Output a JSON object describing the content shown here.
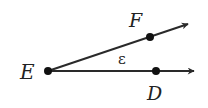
{
  "diagram": {
    "vertex": {
      "label": "E",
      "x": 48,
      "y": 71
    },
    "rays": [
      {
        "name": "ray-ED",
        "point_label": "D",
        "point": {
          "x": 156,
          "y": 71
        },
        "end": {
          "x": 194,
          "y": 71
        }
      },
      {
        "name": "ray-EF",
        "point_label": "F",
        "point": {
          "x": 150,
          "y": 37
        },
        "end": {
          "x": 188,
          "y": 24
        }
      }
    ],
    "angle_label": "ε",
    "colors": {
      "line": "#2a2a2a",
      "point": "#111111"
    }
  }
}
